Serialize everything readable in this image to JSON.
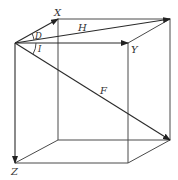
{
  "diagram": {
    "type": "cube-vectors",
    "labels": {
      "x": "X",
      "y": "Y",
      "z": "Z",
      "h": "H",
      "f": "F",
      "angle_d": "D",
      "angle_i": "I"
    },
    "colors": {
      "line": "#4a4a4a",
      "vector": "#2a2a2a",
      "text": "#333333",
      "background": "#ffffff"
    }
  }
}
